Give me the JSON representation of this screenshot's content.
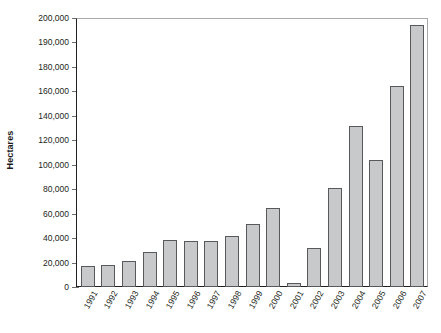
{
  "chart_data": {
    "type": "bar",
    "title": "",
    "subtitle": "",
    "xlabel": "",
    "ylabel": "Hectares",
    "ylim": [
      0,
      200000
    ],
    "grid": false,
    "legend": null,
    "legend_position": "none",
    "bar_color": "#c8c9ca",
    "bar_border_color": "#58595b",
    "axis_color": "#231f20",
    "ytick_labels": [
      "0",
      "20,000",
      "40,000",
      "60,000",
      "80,000",
      "100,000",
      "120,000",
      "140,000",
      "160,000",
      "180,000",
      "190,000",
      "200,000"
    ],
    "ytick_values": [
      0,
      20000,
      40000,
      60000,
      80000,
      100000,
      120000,
      140000,
      160000,
      180000,
      190000,
      200000
    ],
    "categories": [
      "1991",
      "1992",
      "1993",
      "1994",
      "1995",
      "1996",
      "1997",
      "1998",
      "1999",
      "2000",
      "2001",
      "2002",
      "2003",
      "2004",
      "2005",
      "2006",
      "2007"
    ],
    "values": [
      17000,
      18000,
      21500,
      28500,
      38500,
      37500,
      38000,
      41500,
      51500,
      65000,
      3000,
      31500,
      81000,
      131500,
      104000,
      164500,
      197000
    ]
  }
}
